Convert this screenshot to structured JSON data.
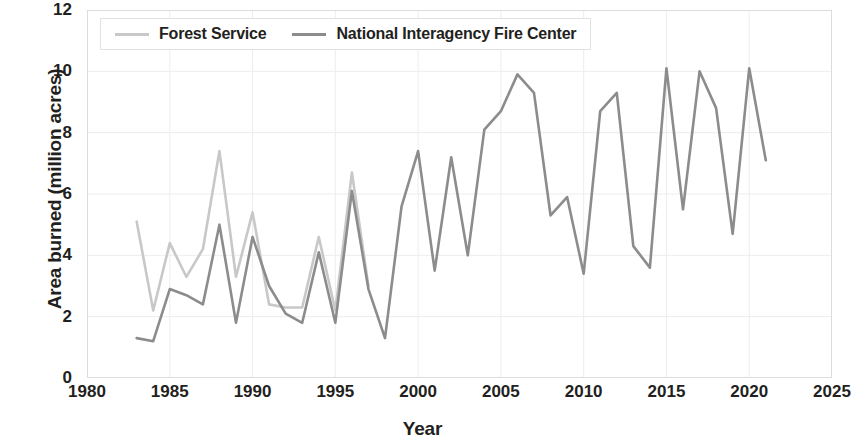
{
  "chart_data": {
    "type": "line",
    "title": "",
    "xlabel": "Year",
    "ylabel": "Area burned (million acres)",
    "xlim": [
      1980,
      2025
    ],
    "ylim": [
      0,
      12
    ],
    "xticks": [
      1980,
      1985,
      1990,
      1995,
      2000,
      2005,
      2010,
      2015,
      2020,
      2025
    ],
    "yticks": [
      0,
      2,
      4,
      6,
      8,
      10,
      12
    ],
    "grid": true,
    "legend_position": "top-left",
    "series": [
      {
        "name": "Forest Service",
        "color": "#c8c8c8",
        "x": [
          1983,
          1984,
          1985,
          1986,
          1987,
          1988,
          1989,
          1990,
          1991,
          1992,
          1993,
          1994,
          1995,
          1996,
          1997
        ],
        "values": [
          5.1,
          2.2,
          4.4,
          3.3,
          4.2,
          7.4,
          3.3,
          5.4,
          2.4,
          2.3,
          2.3,
          4.6,
          2.2,
          6.7,
          3.0
        ]
      },
      {
        "name": "National Interagency Fire Center",
        "color": "#8c8c8c",
        "x": [
          1983,
          1984,
          1985,
          1986,
          1987,
          1988,
          1989,
          1990,
          1991,
          1992,
          1993,
          1994,
          1995,
          1996,
          1997,
          1998,
          1999,
          2000,
          2001,
          2002,
          2003,
          2004,
          2005,
          2006,
          2007,
          2008,
          2009,
          2010,
          2011,
          2012,
          2013,
          2014,
          2015,
          2016,
          2017,
          2018,
          2019,
          2020,
          2021
        ],
        "values": [
          1.3,
          1.2,
          2.9,
          2.7,
          2.4,
          5.0,
          1.8,
          4.6,
          3.0,
          2.1,
          1.8,
          4.1,
          1.8,
          6.1,
          2.9,
          1.3,
          5.6,
          7.4,
          3.5,
          7.2,
          4.0,
          8.1,
          8.7,
          9.9,
          9.3,
          5.3,
          5.9,
          3.4,
          8.7,
          9.3,
          4.3,
          3.6,
          10.1,
          5.5,
          10.0,
          8.8,
          4.7,
          10.1,
          7.1
        ]
      }
    ]
  },
  "axes": {
    "y_title": "Area burned (million acres)",
    "x_title": "Year",
    "y_tick_labels": [
      "12",
      "10",
      "8",
      "6",
      "4",
      "2",
      "0"
    ],
    "x_tick_labels": [
      "1980",
      "1985",
      "1990",
      "1995",
      "2000",
      "2005",
      "2010",
      "2015",
      "2020",
      "2025"
    ]
  },
  "legend": {
    "items": [
      {
        "label": "Forest Service",
        "color": "#c8c8c8"
      },
      {
        "label": "National Interagency Fire Center",
        "color": "#8c8c8c"
      }
    ]
  }
}
